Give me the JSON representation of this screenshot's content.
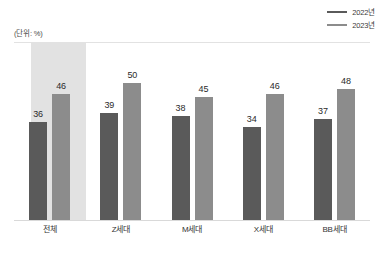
{
  "chart_data": {
    "type": "bar",
    "title": "",
    "subtitle": "",
    "unit_note": "(단위: %)",
    "xlabel": "",
    "ylabel": "",
    "ylim": [
      0,
      60
    ],
    "grid": false,
    "legend_position": "top-right",
    "categories": [
      "전체",
      "Z세대",
      "M세대",
      "X세대",
      "BB세대"
    ],
    "series": [
      {
        "name": "2022년",
        "color": "#5a5a5a",
        "values": [
          36,
          39,
          38,
          34,
          37
        ]
      },
      {
        "name": "2023년",
        "color": "#8c8c8c",
        "values": [
          46,
          50,
          45,
          46,
          48
        ]
      }
    ],
    "highlighted_category": "전체",
    "highlight_color": "#e2e2e2"
  },
  "legend": {
    "items": [
      {
        "label": "2022년"
      },
      {
        "label": "2023년"
      }
    ]
  },
  "axis": {
    "unit_note": "(단위: %)"
  }
}
